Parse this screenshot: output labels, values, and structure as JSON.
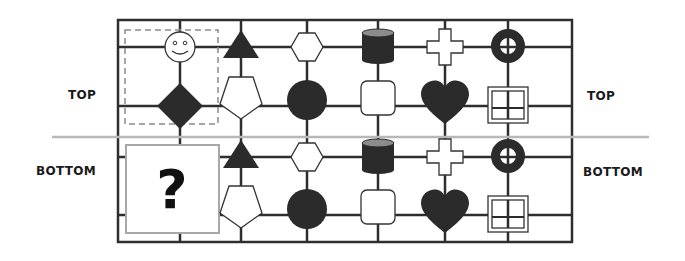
{
  "labels": {
    "top_left": "TOP",
    "top_right": "TOP",
    "bottom_left": "BOTTOM",
    "bottom_right": "BOTTOM",
    "missing": "?"
  },
  "colors": {
    "grid": "#2e2e2e",
    "shape_dark": "#2b2b2b",
    "shape_outline": "#333333",
    "divider": "#b8b8b8",
    "dashed_box": "#8a8a8a",
    "question_box": "#a8a8a8",
    "cylinder_top": "#8c8c8c"
  },
  "panels": {
    "top": {
      "columns": [
        {
          "upper": "smiley-face",
          "lower": "filled-diamond",
          "highlighted": true
        },
        {
          "upper": "filled-triangle",
          "lower": "outline-pentagon"
        },
        {
          "upper": "outline-hexagon",
          "lower": "filled-circle"
        },
        {
          "upper": "filled-cylinder",
          "lower": "outline-rounded-square"
        },
        {
          "upper": "outline-cross",
          "lower": "filled-heart"
        },
        {
          "upper": "filled-ring",
          "lower": "outline-window"
        }
      ]
    },
    "bottom": {
      "columns": [
        {
          "upper": "missing",
          "lower": "missing",
          "question": true
        },
        {
          "upper": "filled-triangle",
          "lower": "outline-pentagon"
        },
        {
          "upper": "outline-hexagon",
          "lower": "filled-circle"
        },
        {
          "upper": "filled-cylinder",
          "lower": "outline-rounded-square"
        },
        {
          "upper": "outline-cross",
          "lower": "filled-heart"
        },
        {
          "upper": "filled-ring",
          "lower": "outline-window"
        }
      ]
    }
  }
}
